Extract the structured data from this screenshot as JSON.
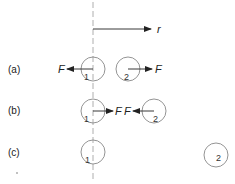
{
  "diagram": {
    "axis_label": "r",
    "force_label": "F",
    "rows": [
      {
        "label": "(a)",
        "particle1": "1",
        "particle2": "2",
        "description": "repulsive forces: F on 1 points left, F on 2 points right"
      },
      {
        "label": "(b)",
        "particle1": "1",
        "particle2": "2",
        "description": "attractive forces: F on 1 points right, F on 2 points left"
      },
      {
        "label": "(c)",
        "particle1": "1",
        "particle2": "2",
        "description": "particles far apart, no forces shown"
      }
    ],
    "colors": {
      "line": "#222222",
      "circle": "#888888",
      "dashed": "#999999"
    }
  }
}
